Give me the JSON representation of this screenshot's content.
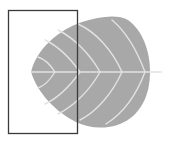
{
  "figure": {
    "subject": "leaf",
    "colors": {
      "background": "#ffffff",
      "leaf_fill": "#a8a8a8",
      "vein": "#e2e2e2",
      "frame_stroke": "#3a3a3a"
    },
    "frame": {
      "x": 8,
      "y": 10,
      "width": 70,
      "height": 124
    },
    "leaf": {
      "tip_left": [
        31,
        72
      ],
      "right_edge_x": 150,
      "top_y": 17,
      "bottom_y": 128,
      "midrib_y": 72,
      "stem_end_x": 162
    }
  }
}
